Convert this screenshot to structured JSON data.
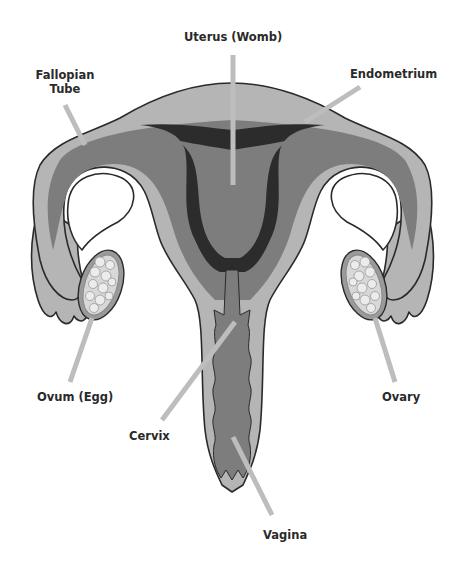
{
  "colors": {
    "outer_tissue": "#b5b5b5",
    "myometrium": "#7d7d7d",
    "endometrium": "#2c2c2c",
    "leader_line": "#bdbdbd",
    "outline": "#2a2a2a",
    "ovary_fill": "#9a9a9a",
    "follicle": "#e0e0e0",
    "background": "#ffffff"
  },
  "labels": {
    "uterus": "Uterus (Womb)",
    "fallopian_line1": "Fallopian",
    "fallopian_line2": "Tube",
    "endometrium": "Endometrium",
    "ovum": "Ovum (Egg)",
    "ovary": "Ovary",
    "cervix": "Cervix",
    "vagina": "Vagina"
  }
}
